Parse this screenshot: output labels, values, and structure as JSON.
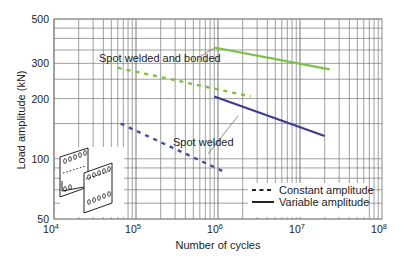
{
  "chart_data": {
    "type": "line",
    "title": "",
    "xlabel": "Number of cycles",
    "ylabel": "Load amplitude (kN)",
    "xscale": "log",
    "yscale": "log",
    "xlim": [
      10000,
      100000000
    ],
    "ylim": [
      50,
      500
    ],
    "grid": true,
    "x_ticks": [
      {
        "value": 10000,
        "base": "10",
        "exp": "4"
      },
      {
        "value": 100000,
        "base": "10",
        "exp": "5"
      },
      {
        "value": 1000000,
        "base": "10",
        "exp": "6"
      },
      {
        "value": 10000000,
        "base": "10",
        "exp": "7"
      },
      {
        "value": 100000000,
        "base": "10",
        "exp": "8"
      }
    ],
    "y_ticks": [
      {
        "value": 50,
        "label": "50"
      },
      {
        "value": 100,
        "label": "100"
      },
      {
        "value": 200,
        "label": "200"
      },
      {
        "value": 300,
        "label": "300"
      },
      {
        "value": 500,
        "label": "500"
      }
    ],
    "series": [
      {
        "name": "Spot welded and bonded - Variable amplitude",
        "style": "solid",
        "color": "#7ac143",
        "x": [
          900000,
          23000000
        ],
        "y": [
          360,
          280
        ]
      },
      {
        "name": "Spot welded and bonded - Constant amplitude",
        "style": "dashed",
        "color": "#7ac143",
        "x": [
          60000,
          2500000
        ],
        "y": [
          285,
          205
        ]
      },
      {
        "name": "Spot welded - Variable amplitude",
        "style": "solid",
        "color": "#3d3d8f",
        "x": [
          900000,
          20000000
        ],
        "y": [
          205,
          130
        ]
      },
      {
        "name": "Spot welded - Constant amplitude",
        "style": "dashed",
        "color": "#4a4aa0",
        "x": [
          65000,
          1200000
        ],
        "y": [
          150,
          86
        ]
      }
    ],
    "annotations": [
      {
        "text": "Spot welded and bonded",
        "target_series": 0
      },
      {
        "text": "Spot welded",
        "target_series": 2
      }
    ],
    "legend": {
      "position": "lower right",
      "entries": [
        {
          "label": "Constant amplitude",
          "style": "dashed"
        },
        {
          "label": "Variable amplitude",
          "style": "solid"
        }
      ]
    },
    "inset": "sketch of spot-welded/bonded overlapping plate specimen"
  }
}
